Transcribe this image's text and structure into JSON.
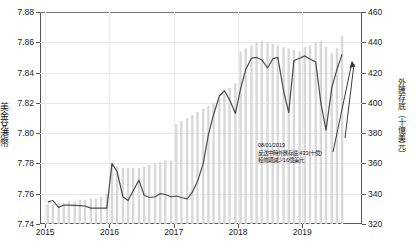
{
  "chart_data": {
    "type": "line",
    "title": "",
    "subtitle": "",
    "xlabel": "",
    "ylabel": "美金兌港幣",
    "ylabel_right": "外匯存底（十億美元）",
    "grid": true,
    "legend_position": "none",
    "x_tick_labels": [
      "2015",
      "2016",
      "2017",
      "2018",
      "2019"
    ],
    "xlim_years": [
      2014.92,
      2019.93
    ],
    "ylim": [
      7.74,
      7.88
    ],
    "y_ticks": [
      "7.74",
      "7.76",
      "7.78",
      "7.80",
      "7.82",
      "7.84",
      "7.86",
      "7.88"
    ],
    "ylim_right": [
      320,
      460
    ],
    "y_ticks_right": [
      "320",
      "340",
      "360",
      "380",
      "400",
      "420",
      "440",
      "460"
    ],
    "series": [
      {
        "name": "美金兌港幣",
        "type": "line",
        "color": "#4a4a4a",
        "x": [
          2015.04,
          2015.12,
          2015.21,
          2015.29,
          2015.37,
          2015.46,
          2015.54,
          2015.62,
          2015.71,
          2015.79,
          2015.87,
          2015.96,
          2016.04,
          2016.12,
          2016.21,
          2016.29,
          2016.37,
          2016.46,
          2016.54,
          2016.62,
          2016.71,
          2016.79,
          2016.87,
          2016.96,
          2017.04,
          2017.12,
          2017.21,
          2017.29,
          2017.37,
          2017.46,
          2017.54,
          2017.62,
          2017.71,
          2017.79,
          2017.87,
          2017.96,
          2018.04,
          2018.12,
          2018.21,
          2018.29,
          2018.37,
          2018.46,
          2018.54,
          2018.62,
          2018.71,
          2018.79,
          2018.87,
          2018.96,
          2019.04,
          2019.12,
          2019.21,
          2019.29,
          2019.37,
          2019.46,
          2019.54,
          2019.62
        ],
        "values": [
          7.7545,
          7.7555,
          7.751,
          7.7525,
          7.7525,
          7.7523,
          7.7522,
          7.7519,
          7.7505,
          7.7505,
          7.7505,
          7.7505,
          7.78,
          7.7745,
          7.758,
          7.7555,
          7.762,
          7.769,
          7.759,
          7.7575,
          7.758,
          7.76,
          7.7595,
          7.758,
          7.7585,
          7.7575,
          7.7565,
          7.761,
          7.768,
          7.78,
          7.799,
          7.812,
          7.8245,
          7.828,
          7.822,
          7.813,
          7.829,
          7.842,
          7.8495,
          7.85,
          7.8485,
          7.843,
          7.849,
          7.85,
          7.828,
          7.8135,
          7.848,
          7.8495,
          7.851,
          7.849,
          7.847,
          7.82,
          7.802,
          7.83,
          7.842,
          7.852
        ]
      },
      {
        "name": "外匯存底",
        "type": "bar",
        "color": "#d8d8d8",
        "values_right_axis": [
          333,
          333,
          334,
          334,
          335,
          335,
          336,
          336,
          337,
          337,
          338,
          340,
          360,
          358,
          357,
          357,
          357,
          357,
          358,
          359,
          360,
          361,
          362,
          362,
          386,
          388,
          390,
          392,
          394,
          396,
          398,
          400,
          403,
          406,
          410,
          413,
          434,
          436,
          438,
          440,
          441,
          440,
          439,
          438,
          437,
          436,
          435,
          434,
          437,
          438,
          440,
          441,
          437,
          433,
          436,
          444
        ]
      }
    ],
    "annotation": {
      "line1": "08/01/2019",
      "line2": "反送中時外匯存底:433(十億)",
      "line3": "較前期減少16億美元",
      "arrow": "up-arrow-annotation"
    }
  }
}
